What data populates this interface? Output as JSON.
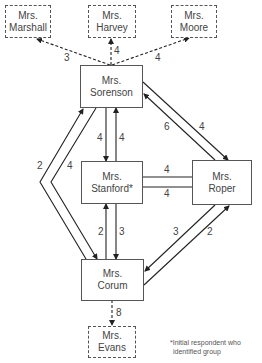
{
  "nodes": {
    "marshall": {
      "line1": "Mrs.",
      "line2": "Marshall",
      "style": "dashed"
    },
    "harvey": {
      "line1": "Mrs.",
      "line2": "Harvey",
      "style": "dashed"
    },
    "moore": {
      "line1": "Mrs.",
      "line2": "Moore",
      "style": "dashed"
    },
    "sorenson": {
      "line1": "Mrs.",
      "line2": "Sorenson",
      "style": "solid"
    },
    "stanford": {
      "line1": "Mrs.",
      "line2": "Stanford*",
      "style": "solid"
    },
    "roper": {
      "line1": "Mrs.",
      "line2": "Roper",
      "style": "solid"
    },
    "corum": {
      "line1": "Mrs.",
      "line2": "Corum",
      "style": "solid"
    },
    "evans": {
      "line1": "Mrs.",
      "line2": "Evans",
      "style": "dashed"
    }
  },
  "edges": [
    {
      "from": "Sorenson",
      "to": "Marshall",
      "weight": "3",
      "style": "dashed"
    },
    {
      "from": "Sorenson",
      "to": "Harvey",
      "weight": "4",
      "style": "dashed"
    },
    {
      "from": "Sorenson",
      "to": "Moore",
      "weight": "4",
      "style": "dashed"
    },
    {
      "from": "Sorenson",
      "to": "Stanford",
      "weight": "4",
      "style": "solid"
    },
    {
      "from": "Stanford",
      "to": "Sorenson",
      "weight": "4",
      "style": "solid"
    },
    {
      "from": "Roper",
      "to": "Sorenson",
      "weight": "6",
      "style": "solid"
    },
    {
      "from": "Sorenson",
      "to": "Roper",
      "weight": "4",
      "style": "solid"
    },
    {
      "from": "Corum",
      "to": "Sorenson",
      "weight": "2",
      "style": "solid"
    },
    {
      "from": "Sorenson",
      "to": "Corum",
      "weight": "4",
      "style": "solid"
    },
    {
      "from": "Stanford",
      "to": "Roper",
      "weight": "4",
      "style": "solid"
    },
    {
      "from": "Roper",
      "to": "Stanford",
      "weight": "4",
      "style": "solid"
    },
    {
      "from": "Corum",
      "to": "Stanford",
      "weight": "2",
      "style": "solid"
    },
    {
      "from": "Stanford",
      "to": "Corum",
      "weight": "3",
      "style": "solid"
    },
    {
      "from": "Roper",
      "to": "Corum",
      "weight": "3",
      "style": "solid"
    },
    {
      "from": "Corum",
      "to": "Roper",
      "weight": "2",
      "style": "solid"
    },
    {
      "from": "Corum",
      "to": "Evans",
      "weight": "8",
      "style": "dashed"
    }
  ],
  "footnote": {
    "line1": "*Initial respondent who",
    "line2": "identified group"
  }
}
